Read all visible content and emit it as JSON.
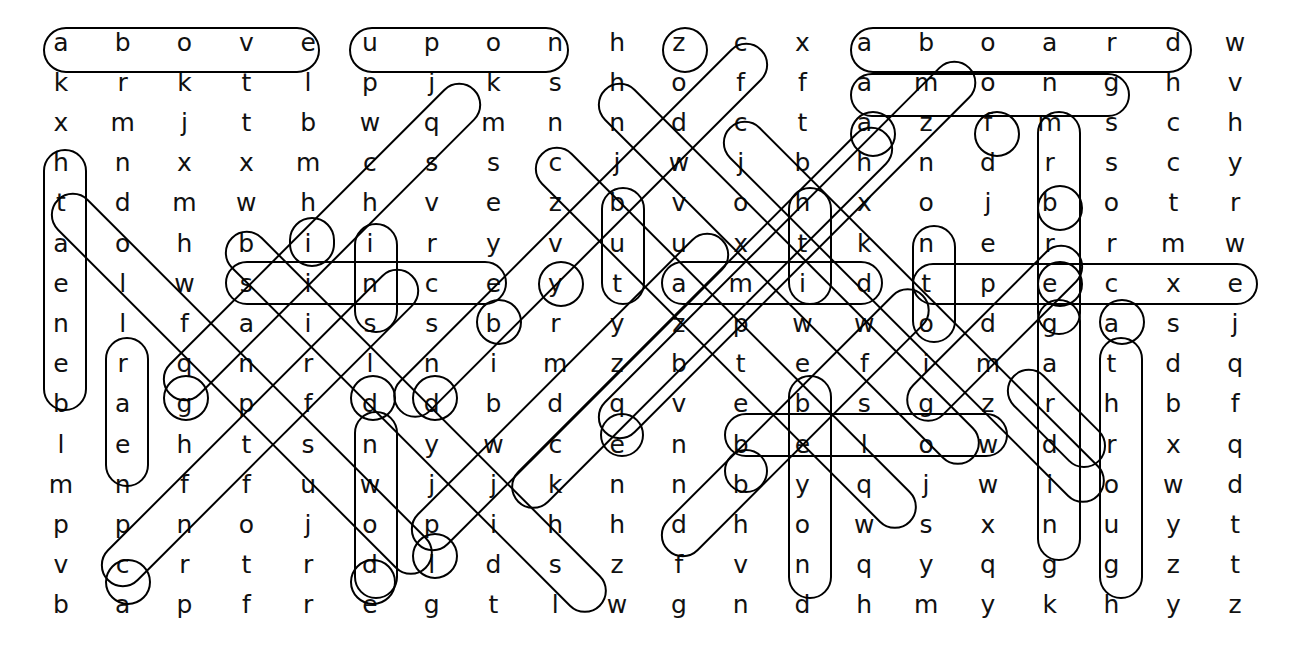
{
  "puzzle": {
    "kind": "word-search",
    "rows": 15,
    "cols": 20,
    "ink_color": "#000000",
    "letter_color": "#111111",
    "background": "#ffffff",
    "grid": [
      [
        "a",
        "b",
        "o",
        "v",
        "e",
        "u",
        "p",
        "o",
        "n",
        "h",
        "z",
        "c",
        "x",
        "a",
        "b",
        "o",
        "a",
        "r",
        "d",
        "w"
      ],
      [
        "k",
        "r",
        "k",
        "t",
        "l",
        "p",
        "j",
        "k",
        "s",
        "h",
        "o",
        "f",
        "f",
        "a",
        "m",
        "o",
        "n",
        "g",
        "h",
        "v"
      ],
      [
        "x",
        "m",
        "j",
        "t",
        "b",
        "w",
        "q",
        "m",
        "n",
        "n",
        "d",
        "c",
        "t",
        "a",
        "z",
        "f",
        "m",
        "s",
        "c",
        "h"
      ],
      [
        "h",
        "n",
        "x",
        "x",
        "m",
        "c",
        "s",
        "s",
        "c",
        "j",
        "w",
        "j",
        "b",
        "h",
        "n",
        "d",
        "r",
        "s",
        "c",
        "y"
      ],
      [
        "t",
        "d",
        "m",
        "w",
        "h",
        "h",
        "v",
        "e",
        "z",
        "b",
        "v",
        "o",
        "h",
        "x",
        "o",
        "j",
        "b",
        "o",
        "t",
        "r"
      ],
      [
        "a",
        "o",
        "h",
        "b",
        "i",
        "i",
        "r",
        "y",
        "v",
        "u",
        "u",
        "x",
        "t",
        "k",
        "n",
        "e",
        "r",
        "r",
        "m",
        "w"
      ],
      [
        "e",
        "l",
        "w",
        "s",
        "i",
        "n",
        "c",
        "e",
        "y",
        "t",
        "a",
        "m",
        "i",
        "d",
        "t",
        "p",
        "e",
        "c",
        "x",
        "e"
      ],
      [
        "n",
        "l",
        "f",
        "a",
        "i",
        "s",
        "s",
        "b",
        "r",
        "y",
        "z",
        "p",
        "w",
        "w",
        "o",
        "d",
        "g",
        "a",
        "s",
        "j"
      ],
      [
        "e",
        "r",
        "q",
        "n",
        "r",
        "l",
        "n",
        "i",
        "m",
        "z",
        "b",
        "t",
        "e",
        "f",
        "i",
        "m",
        "a",
        "t",
        "d",
        "q"
      ],
      [
        "b",
        "a",
        "g",
        "p",
        "f",
        "d",
        "d",
        "b",
        "d",
        "q",
        "v",
        "e",
        "b",
        "s",
        "g",
        "z",
        "r",
        "h",
        "b",
        "f"
      ],
      [
        "l",
        "e",
        "h",
        "t",
        "s",
        "n",
        "y",
        "w",
        "c",
        "e",
        "n",
        "b",
        "e",
        "l",
        "o",
        "w",
        "d",
        "r",
        "x",
        "q"
      ],
      [
        "m",
        "n",
        "f",
        "f",
        "u",
        "w",
        "j",
        "j",
        "k",
        "n",
        "n",
        "b",
        "y",
        "q",
        "j",
        "w",
        "i",
        "o",
        "w",
        "d"
      ],
      [
        "p",
        "p",
        "n",
        "o",
        "j",
        "o",
        "p",
        "i",
        "h",
        "h",
        "d",
        "h",
        "o",
        "w",
        "s",
        "x",
        "n",
        "u",
        "y",
        "t"
      ],
      [
        "v",
        "c",
        "r",
        "t",
        "r",
        "d",
        "l",
        "d",
        "s",
        "z",
        "f",
        "v",
        "n",
        "q",
        "y",
        "q",
        "g",
        "g",
        "z",
        "t"
      ],
      [
        "b",
        "a",
        "p",
        "f",
        "r",
        "e",
        "g",
        "t",
        "l",
        "w",
        "g",
        "n",
        "d",
        "h",
        "m",
        "y",
        "k",
        "h",
        "y",
        "z"
      ]
    ],
    "found_words": [
      {
        "word": "above",
        "start": [
          1,
          1
        ],
        "end": [
          1,
          5
        ],
        "dir": "horizontal"
      },
      {
        "word": "upon",
        "start": [
          1,
          6
        ],
        "end": [
          1,
          9
        ],
        "dir": "horizontal"
      },
      {
        "word": "aboard",
        "start": [
          1,
          14
        ],
        "end": [
          1,
          19
        ],
        "dir": "horizontal"
      },
      {
        "word": "among",
        "start": [
          2,
          14
        ],
        "end": [
          2,
          18
        ],
        "dir": "horizontal"
      },
      {
        "word": "since",
        "start": [
          7,
          4
        ],
        "end": [
          7,
          8
        ],
        "dir": "horizontal"
      },
      {
        "word": "amid",
        "start": [
          7,
          11
        ],
        "end": [
          7,
          14
        ],
        "dir": "horizontal"
      },
      {
        "word": "below",
        "start": [
          11,
          12
        ],
        "end": [
          11,
          16
        ],
        "dir": "horizontal"
      },
      {
        "word": "beneath",
        "start": [
          4,
          1
        ],
        "end": [
          10,
          1
        ],
        "dir": "vertical"
      },
      {
        "word": "but",
        "start": [
          5,
          10
        ],
        "end": [
          7,
          10
        ],
        "dir": "vertical"
      },
      {
        "word": "the",
        "start": [
          5,
          13
        ],
        "end": [
          7,
          13
        ],
        "dir": "vertical"
      },
      {
        "word": "onto",
        "start": [
          6,
          15
        ],
        "end": [
          9,
          15
        ],
        "dir": "vertical"
      },
      {
        "word": "beyond",
        "start": [
          10,
          13
        ],
        "end": [
          15,
          13
        ],
        "dir": "vertical"
      },
      {
        "word": "regarding",
        "start": [
          6,
          17
        ],
        "end": [
          14,
          17
        ],
        "dir": "vertical"
      },
      {
        "word": "through",
        "start": [
          9,
          18
        ],
        "end": [
          15,
          18
        ],
        "dir": "vertical"
      },
      {
        "word": "across",
        "start": [
          3,
          16
        ],
        "end": [
          8,
          16
        ],
        "dir": "vertical"
      },
      {
        "word": "inside",
        "start": [
          6,
          6
        ],
        "end": [
          11,
          6
        ],
        "dir": "vertical"
      },
      {
        "word": "barren",
        "start": [
          9,
          2
        ],
        "end": [
          14,
          2
        ],
        "dir": "vertical"
      },
      {
        "word": "down",
        "start": [
          12,
          5
        ],
        "end": [
          15,
          5
        ],
        "dir": "diag"
      },
      {
        "word": "toward",
        "start": [
          1,
          12
        ],
        "end": [
          7,
          6
        ],
        "dir": "diag-down-left"
      },
      {
        "word": "between",
        "start": [
          1,
          12
        ],
        "end": [
          7,
          6
        ],
        "dir": "diag"
      },
      {
        "word": "against",
        "start": [
          3,
          14
        ],
        "end": [
          9,
          8
        ],
        "dir": "diag"
      },
      {
        "word": "before",
        "start": [
          10,
          3
        ],
        "end": [
          5,
          8
        ],
        "dir": "diag"
      },
      {
        "word": "behind",
        "start": [
          15,
          2
        ],
        "end": [
          10,
          7
        ],
        "dir": "diag"
      },
      {
        "word": "beside",
        "start": [
          14,
          6
        ],
        "end": [
          9,
          11
        ],
        "dir": "diag"
      },
      {
        "word": "except",
        "start": [
          7,
          10
        ],
        "end": [
          7,
          20
        ],
        "dir": "horizontal"
      },
      {
        "word": "during",
        "start": [
          11,
          10
        ],
        "end": [
          5,
          16
        ],
        "dir": "diag"
      }
    ]
  }
}
